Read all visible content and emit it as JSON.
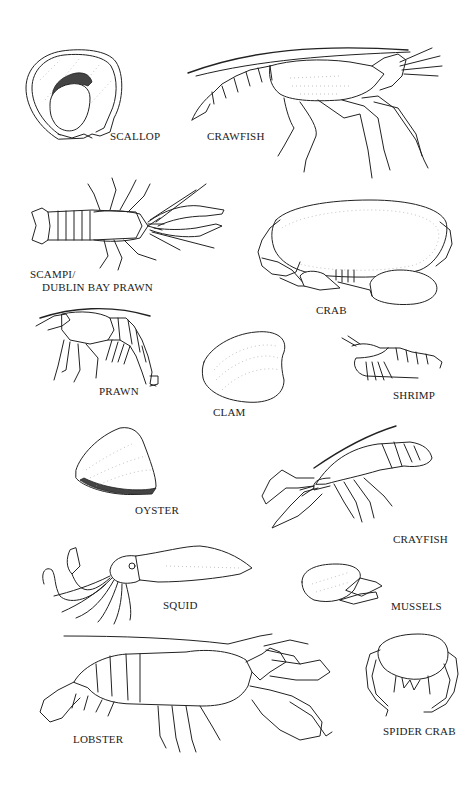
{
  "figure": {
    "background": "#ffffff",
    "ink_color": "#222222",
    "style": "line-art illustration"
  },
  "specimens": [
    {
      "id": "scallop",
      "label": "SCALLOP"
    },
    {
      "id": "crawfish",
      "label": "CRAWFISH"
    },
    {
      "id": "scampi",
      "label_line1": "SCAMPI/",
      "label_line2": "DUBLIN BAY PRAWN"
    },
    {
      "id": "crab",
      "label": "CRAB"
    },
    {
      "id": "prawn",
      "label": "PRAWN"
    },
    {
      "id": "clam",
      "label": "CLAM"
    },
    {
      "id": "shrimp",
      "label": "SHRIMP"
    },
    {
      "id": "oyster",
      "label": "OYSTER"
    },
    {
      "id": "crayfish",
      "label": "CRAYFISH"
    },
    {
      "id": "squid",
      "label": "SQUID"
    },
    {
      "id": "mussels",
      "label": "MUSSELS"
    },
    {
      "id": "lobster",
      "label": "LOBSTER"
    },
    {
      "id": "spider-crab",
      "label": "SPIDER CRAB"
    }
  ]
}
